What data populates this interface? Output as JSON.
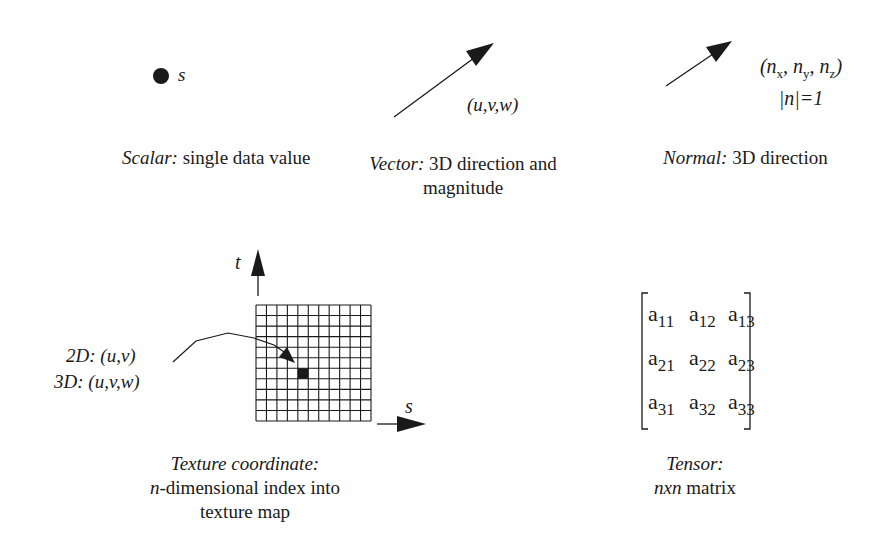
{
  "figure": {
    "type": "data-attribute-types-diagram",
    "panels": [
      {
        "id": "scalar",
        "symbol": "s",
        "caption_term": "Scalar:",
        "caption_desc": "single data value"
      },
      {
        "id": "vector",
        "symbol": "(u,v,w)",
        "caption_term": "Vector:",
        "caption_desc_line1": "3D direction and",
        "caption_desc_line2": "magnitude"
      },
      {
        "id": "normal",
        "symbol_line1_prefix": "(n",
        "symbol_sub_x": "x",
        "symbol_sep1": ", n",
        "symbol_sub_y": "y",
        "symbol_sep2": ", n",
        "symbol_sub_z": "z",
        "symbol_line1_suffix": ")",
        "symbol_line2": "|n|=1",
        "caption_term": "Normal:",
        "caption_desc": "3D direction"
      },
      {
        "id": "texture",
        "axis_t": "t",
        "axis_s": "s",
        "label_2d": "2D: (u,v)",
        "label_3d": "3D: (u,v,w)",
        "grid": {
          "columns": 11,
          "rows": 11,
          "highlighted_cell": {
            "col": 4,
            "row": 6
          }
        },
        "caption_term": "Texture coordinate:",
        "caption_desc_line1_italic": "n",
        "caption_desc_line1": "-dimensional index into",
        "caption_desc_line2": "texture map"
      },
      {
        "id": "tensor",
        "matrix": [
          [
            {
              "a": "a",
              "sub": "11"
            },
            {
              "a": "a",
              "sub": "12"
            },
            {
              "a": "a",
              "sub": "13"
            }
          ],
          [
            {
              "a": "a",
              "sub": "21"
            },
            {
              "a": "a",
              "sub": "22"
            },
            {
              "a": "a",
              "sub": "23"
            }
          ],
          [
            {
              "a": "a",
              "sub": "31"
            },
            {
              "a": "a",
              "sub": "32"
            },
            {
              "a": "a",
              "sub": "33"
            }
          ]
        ],
        "caption_term": "Tensor:",
        "caption_desc_italic": "nxn",
        "caption_desc": "matrix"
      }
    ],
    "colors": {
      "ink": "#1a1a1a",
      "background": "#ffffff"
    }
  }
}
